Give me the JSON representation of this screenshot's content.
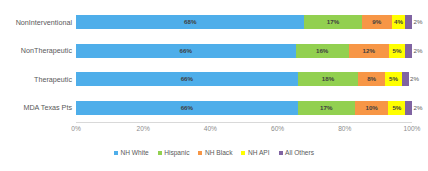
{
  "chart_data": {
    "type": "bar",
    "subtype": "stacked-horizontal-100pct",
    "title": "",
    "xlabel": "",
    "ylabel": "",
    "xlim": [
      0,
      100
    ],
    "grid": false,
    "legend_position": "bottom",
    "axis": {
      "ticks": [
        "0%",
        "20%",
        "40%",
        "60%",
        "80%",
        "100%"
      ],
      "tick_values": [
        0,
        20,
        40,
        60,
        80,
        100
      ]
    },
    "categories": [
      "NonInterventional",
      "NonTherapeutic",
      "Therapeutic",
      "MDA Texas Pts"
    ],
    "series": [
      {
        "name": "NH White",
        "color": "#4eaeea",
        "values": [
          68,
          66,
          66,
          66
        ],
        "labels": [
          "68%",
          "66%",
          "66%",
          "66%"
        ]
      },
      {
        "name": "Hispanic",
        "color": "#92d050",
        "values": [
          17,
          16,
          18,
          17
        ],
        "labels": [
          "17%",
          "16%",
          "18%",
          "17%"
        ]
      },
      {
        "name": "NH Black",
        "color": "#f79646",
        "values": [
          9,
          12,
          8,
          10
        ],
        "labels": [
          "9%",
          "12%",
          "8%",
          "10%"
        ]
      },
      {
        "name": "NH API",
        "color": "#ffff00",
        "values": [
          4,
          5,
          5,
          5
        ],
        "labels": [
          "4%",
          "5%",
          "5%",
          "5%"
        ]
      },
      {
        "name": "All Others",
        "color": "#8064a2",
        "values": [
          2,
          2,
          2,
          2
        ],
        "labels": [
          "2%",
          "2%",
          "2%",
          "2%"
        ]
      }
    ]
  }
}
